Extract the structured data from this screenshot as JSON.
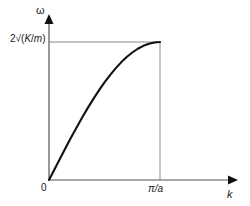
{
  "chart_data": {
    "type": "line",
    "title": "",
    "xlabel": "k",
    "ylabel": "ω",
    "x": [
      0,
      0.05,
      0.1,
      0.15,
      0.2,
      0.25,
      0.3,
      0.35,
      0.4,
      0.45,
      0.5,
      0.55,
      0.6,
      0.65,
      0.7,
      0.75,
      0.8,
      0.85,
      0.9,
      0.95,
      1.0
    ],
    "y": [
      0,
      0.0785,
      0.1564,
      0.2334,
      0.309,
      0.3827,
      0.454,
      0.5225,
      0.5878,
      0.6494,
      0.7071,
      0.7604,
      0.809,
      0.8526,
      0.891,
      0.9239,
      0.9511,
      0.9724,
      0.9877,
      0.9969,
      1.0
    ],
    "x_units": "fraction of π/a",
    "y_units": "fraction of 2√(K/m)",
    "xlim": [
      0,
      1.0
    ],
    "ylim": [
      0,
      1.0
    ],
    "grid": false,
    "legend": null,
    "series_name": "phonon dispersion",
    "curve_color": "#111111",
    "axis_color": "#555555",
    "guide_color": "#8a8a8a",
    "background": "#ffffff",
    "x_ticks": [
      {
        "value": 0,
        "label": "0"
      },
      {
        "value": 1.0,
        "label": "π/a"
      }
    ],
    "y_ticks": [
      {
        "value": 0,
        "label": ""
      },
      {
        "value": 1.0,
        "label": "2√(K/m)"
      }
    ],
    "annotations": []
  },
  "labels": {
    "y_axis_symbol": "ω",
    "x_axis_symbol": "k",
    "y_max_prefix": "2√(",
    "y_max_numerator": "K",
    "y_max_slash": "/",
    "y_max_denominator": "m",
    "y_max_suffix": ")",
    "y_max_full": "2√(K/m)",
    "x_max": "π/a",
    "origin": "0"
  },
  "icons": {
    "y_axis_arrow": "arrow-up-icon",
    "x_axis_arrow": "arrow-right-icon"
  }
}
